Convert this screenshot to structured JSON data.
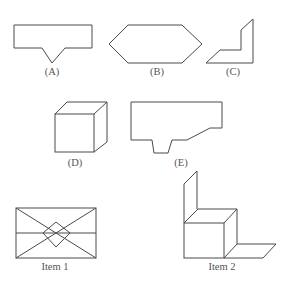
{
  "figure": {
    "labels": {
      "A": "(A)",
      "B": "(B)",
      "C": "(C)",
      "D": "(D)",
      "E": "(E)",
      "item1": "Item 1",
      "item2": "Item 2"
    },
    "colors": {
      "stroke": "#4a4a4a",
      "label": "#555555",
      "background": "#ffffff"
    },
    "options": [
      {
        "id": "A",
        "description": "Rectangle with V-notch point on bottom edge"
      },
      {
        "id": "B",
        "description": "Elongated hexagon"
      },
      {
        "id": "C",
        "description": "L-shaped bracket with slanted ends"
      },
      {
        "id": "D",
        "description": "Cube"
      },
      {
        "id": "E",
        "description": "Pentagon-like shape with trapezoidal tab at bottom and slanted lower right"
      }
    ],
    "items": [
      {
        "id": "item1",
        "description": "Rectangle with diagonals, horizontal midline and inner diamond"
      },
      {
        "id": "item2",
        "description": "Cube with vertical back panel and floor flap"
      }
    ]
  }
}
